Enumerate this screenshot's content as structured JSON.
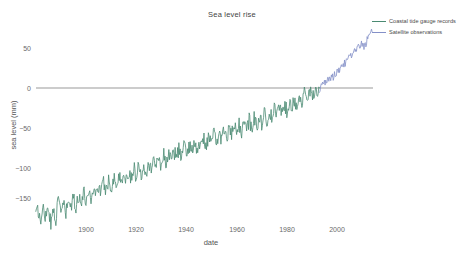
{
  "chart": {
    "title": "Sea level rise",
    "xlabel": "date",
    "ylabel": "sea level (mm)"
  },
  "legend": {
    "items": [
      {
        "label": "Coastal tide gauge records",
        "color": "#4a8a72"
      },
      {
        "label": "Satellite observations",
        "color": "#8490c8"
      }
    ]
  },
  "axes": {
    "x_ticks": [
      "1900",
      "1920",
      "1940",
      "1960",
      "1980",
      "2000"
    ],
    "y_ticks": [
      "50",
      "0",
      "−50",
      "−100",
      "−150"
    ]
  },
  "chart_data": {
    "type": "line",
    "title": "Sea level rise",
    "xlabel": "date",
    "ylabel": "sea level (mm)",
    "xlim": [
      1880,
      2014
    ],
    "ylim": [
      -175,
      85
    ],
    "grid": false,
    "legend_position": "top-right",
    "x_tick_values": [
      1900,
      1920,
      1940,
      1960,
      1980,
      2000
    ],
    "y_tick_values": [
      50,
      0,
      -50,
      -100,
      -150
    ],
    "annotations": [
      {
        "type": "hline",
        "y": 0,
        "color": "#999999",
        "label": "zero reference"
      }
    ],
    "series": [
      {
        "name": "Coastal tide gauge records",
        "color": "#4a8a72",
        "x": [
          1880,
          1881,
          1882,
          1883,
          1884,
          1885,
          1886,
          1887,
          1888,
          1889,
          1890,
          1891,
          1892,
          1893,
          1894,
          1895,
          1896,
          1897,
          1898,
          1899,
          1900,
          1901,
          1902,
          1903,
          1904,
          1905,
          1906,
          1907,
          1908,
          1909,
          1910,
          1911,
          1912,
          1913,
          1914,
          1915,
          1916,
          1917,
          1918,
          1919,
          1920,
          1921,
          1922,
          1923,
          1924,
          1925,
          1926,
          1927,
          1928,
          1929,
          1930,
          1931,
          1932,
          1933,
          1934,
          1935,
          1936,
          1937,
          1938,
          1939,
          1940,
          1941,
          1942,
          1943,
          1944,
          1945,
          1946,
          1947,
          1948,
          1949,
          1950,
          1951,
          1952,
          1953,
          1954,
          1955,
          1956,
          1957,
          1958,
          1959,
          1960,
          1961,
          1962,
          1963,
          1964,
          1965,
          1966,
          1967,
          1968,
          1969,
          1970,
          1971,
          1972,
          1973,
          1974,
          1975,
          1976,
          1977,
          1978,
          1979,
          1980,
          1981,
          1982,
          1983,
          1984,
          1985,
          1986,
          1987,
          1988,
          1989,
          1990,
          1991,
          1992,
          1993
        ],
        "y": [
          -158,
          -153,
          -168,
          -150,
          -160,
          -146,
          -172,
          -150,
          -163,
          -141,
          -152,
          -145,
          -158,
          -140,
          -150,
          -138,
          -148,
          -134,
          -144,
          -130,
          -141,
          -128,
          -138,
          -125,
          -133,
          -122,
          -130,
          -118,
          -128,
          -115,
          -124,
          -112,
          -121,
          -110,
          -118,
          -106,
          -116,
          -104,
          -112,
          -100,
          -110,
          -97,
          -108,
          -95,
          -104,
          -92,
          -101,
          -88,
          -98,
          -86,
          -96,
          -83,
          -94,
          -80,
          -91,
          -78,
          -88,
          -75,
          -86,
          -72,
          -83,
          -70,
          -80,
          -68,
          -78,
          -65,
          -75,
          -63,
          -72,
          -60,
          -70,
          -57,
          -68,
          -55,
          -65,
          -52,
          -63,
          -50,
          -60,
          -47,
          -58,
          -45,
          -55,
          -42,
          -52,
          -40,
          -50,
          -37,
          -47,
          -35,
          -44,
          -32,
          -41,
          -29,
          -38,
          -26,
          -35,
          -23,
          -31,
          -20,
          -28,
          -17,
          -25,
          -14,
          -21,
          -11,
          -18,
          -8,
          -14,
          -5,
          -10,
          -4,
          -2,
          0
        ]
      },
      {
        "name": "Satellite observations",
        "color": "#8490c8",
        "x": [
          1993,
          1994,
          1995,
          1996,
          1997,
          1998,
          1999,
          2000,
          2001,
          2002,
          2003,
          2004,
          2005,
          2006,
          2007,
          2008,
          2009,
          2010,
          2011,
          2012,
          2013,
          2014
        ],
        "y": [
          -2,
          2,
          6,
          9,
          13,
          12,
          16,
          20,
          24,
          27,
          31,
          34,
          38,
          42,
          45,
          48,
          53,
          55,
          52,
          60,
          66,
          70
        ]
      }
    ]
  }
}
